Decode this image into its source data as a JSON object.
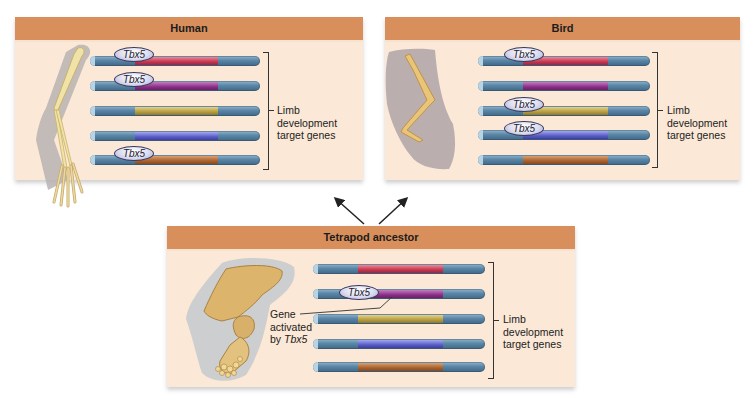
{
  "panels": {
    "human": {
      "title": "Human",
      "bracket_label": [
        "Limb",
        "development",
        "target genes"
      ],
      "genes": [
        {
          "color": "red",
          "tbx5": true
        },
        {
          "color": "purple",
          "tbx5": true
        },
        {
          "color": "olive",
          "tbx5": false
        },
        {
          "color": "blue",
          "tbx5": false
        },
        {
          "color": "brown",
          "tbx5": true
        }
      ],
      "limb": "human-arm-skeleton"
    },
    "bird": {
      "title": "Bird",
      "bracket_label": [
        "Limb",
        "development",
        "target genes"
      ],
      "genes": [
        {
          "color": "red",
          "tbx5": true
        },
        {
          "color": "purple",
          "tbx5": false
        },
        {
          "color": "olive",
          "tbx5": true
        },
        {
          "color": "blue",
          "tbx5": true
        },
        {
          "color": "brown",
          "tbx5": false
        }
      ],
      "limb": "bird-wing-skeleton"
    },
    "ancestor": {
      "title": "Tetrapod ancestor",
      "bracket_label": [
        "Limb",
        "development",
        "target genes"
      ],
      "callout": [
        "Gene",
        "activated",
        "by "
      ],
      "callout_italic": "Tbx5",
      "genes": [
        {
          "color": "red",
          "tbx5": false
        },
        {
          "color": "purple",
          "tbx5": true
        },
        {
          "color": "olive",
          "tbx5": false
        },
        {
          "color": "blue",
          "tbx5": false
        },
        {
          "color": "brown",
          "tbx5": false
        }
      ],
      "limb": "tetrapod-limb-skeleton"
    }
  },
  "tbx5_label": "Tbx5",
  "colors": {
    "header": "#d88f5c",
    "panel_bg": "#fbe8d6",
    "red": "#c5364f",
    "purple": "#8b2f88",
    "olive": "#b79c3e",
    "blue": "#5a5cc6",
    "brown": "#a9622e",
    "dna": "#5b86a6"
  }
}
